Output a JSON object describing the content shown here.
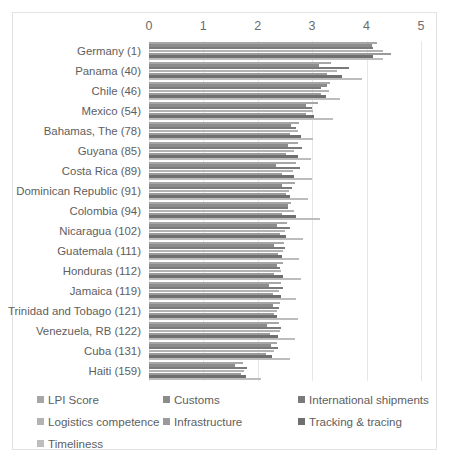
{
  "chart_data": {
    "type": "bar",
    "orientation": "horizontal",
    "title": "",
    "xlabel": "",
    "ylabel": "",
    "xlim": [
      0,
      5
    ],
    "xticks": [
      0,
      1,
      2,
      3,
      4,
      5
    ],
    "grid": true,
    "legend_position": "bottom",
    "categories": [
      "Germany (1)",
      "Panama (40)",
      "Chile (46)",
      "Mexico (54)",
      "Bahamas, The (78)",
      "Guyana (85)",
      "Costa Rica (89)",
      "Dominican Republic  (91)",
      "Colombia (94)",
      "Nicaragua (102)",
      "Guatemala (111)",
      "Honduras (112)",
      "Jamaica (119)",
      "Trinidad and Tobago (121)",
      "Venezuela, RB (122)",
      "Cuba (131)",
      "Haiti (159)"
    ],
    "series": [
      {
        "name": "LPI Score",
        "color": "#a6a6a6",
        "values": [
          4.2,
          3.34,
          3.32,
          3.11,
          2.75,
          2.73,
          2.7,
          2.68,
          2.61,
          2.53,
          2.48,
          2.46,
          2.42,
          2.41,
          2.39,
          2.35,
          1.72
        ]
      },
      {
        "name": "Customs",
        "color": "#8c8c8c",
        "values": [
          4.1,
          3.13,
          3.27,
          2.88,
          2.61,
          2.55,
          2.33,
          2.45,
          2.55,
          2.36,
          2.29,
          2.35,
          2.2,
          2.28,
          2.16,
          2.24,
          1.59
        ]
      },
      {
        "name": "International shipments",
        "color": "#7a7a7a",
        "values": [
          4.12,
          3.68,
          3.17,
          3.0,
          2.7,
          2.81,
          2.78,
          2.62,
          2.55,
          2.59,
          2.5,
          2.41,
          2.46,
          2.39,
          2.42,
          2.38,
          1.8
        ]
      },
      {
        "name": "Logistics competence",
        "color": "#b3b3b3",
        "values": [
          4.3,
          3.45,
          3.3,
          3.02,
          2.74,
          2.66,
          2.64,
          2.58,
          2.67,
          2.5,
          2.46,
          2.43,
          2.39,
          2.36,
          2.41,
          2.29,
          1.75
        ]
      },
      {
        "name": "Infrastructure",
        "color": "#9a9a9a",
        "values": [
          4.44,
          3.28,
          3.17,
          2.89,
          2.6,
          2.52,
          2.45,
          2.52,
          2.44,
          2.41,
          2.38,
          2.3,
          2.28,
          2.3,
          2.22,
          2.15,
          1.7
        ]
      },
      {
        "name": "Tracking & tracing",
        "color": "#6f6f6f",
        "values": [
          4.12,
          3.54,
          3.25,
          3.04,
          2.8,
          2.74,
          2.67,
          2.6,
          2.7,
          2.52,
          2.44,
          2.47,
          2.43,
          2.35,
          2.37,
          2.26,
          1.78
        ]
      },
      {
        "name": "Timeliness",
        "color": "#bdbdbd",
        "values": [
          4.3,
          3.92,
          3.52,
          3.38,
          3.02,
          2.97,
          3.0,
          2.92,
          3.15,
          2.84,
          2.75,
          2.8,
          2.7,
          2.73,
          2.68,
          2.6,
          2.05
        ]
      }
    ]
  }
}
